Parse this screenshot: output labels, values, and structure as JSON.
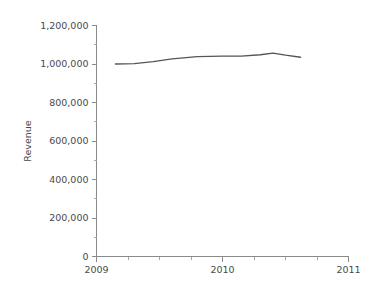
{
  "chart_data": {
    "type": "line",
    "title": "",
    "subtitle": "",
    "xlabel": "",
    "ylabel": "Revenue",
    "xlim": [
      2009,
      2011
    ],
    "ylim": [
      0,
      1200000
    ],
    "grid": false,
    "legend": null,
    "x_ticks": [
      2009,
      2010,
      2011
    ],
    "x_tick_labels": [
      "2009",
      "2010",
      "2011"
    ],
    "x_minor_ticks": [
      2009.25,
      2009.5,
      2009.75,
      2010.25,
      2010.5,
      2010.75
    ],
    "y_ticks": [
      0,
      200000,
      400000,
      600000,
      800000,
      1000000,
      1200000
    ],
    "y_tick_labels": [
      "0",
      "200,000",
      "400,000",
      "600,000",
      "800,000",
      "1,000,000",
      "1,200,000"
    ],
    "y_minor_ticks": [
      100000,
      300000,
      500000,
      700000,
      900000,
      1100000
    ],
    "series": [
      {
        "name": "Revenue",
        "color": "#555555",
        "x": [
          2009.15,
          2009.3,
          2009.45,
          2009.6,
          2009.8,
          2010.0,
          2010.15,
          2010.3,
          2010.4,
          2010.5,
          2010.62
        ],
        "values": [
          1000000,
          1002000,
          1012000,
          1027000,
          1038000,
          1041000,
          1041000,
          1048000,
          1057000,
          1046000,
          1035000
        ]
      }
    ]
  },
  "axes": {
    "y_axis_title": "Revenue"
  },
  "colors": {
    "line": "#555555",
    "axis": "#8a8a8a",
    "text": "#4a4a4a",
    "background": "#ffffff"
  }
}
